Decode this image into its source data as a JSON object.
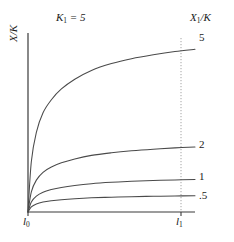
{
  "figure": {
    "title": "K1 = 5",
    "title_parts": {
      "symbol": "K",
      "subscript": "1",
      "equals": " = ",
      "value": "5"
    },
    "background_color": "#ffffff",
    "line_color": "#4a4a4a",
    "axis_color": "#3a3a3a",
    "guide_color": "#9a9a9a"
  },
  "axes": {
    "y_label": "X/K",
    "y_label_parts": {
      "numerator": "X",
      "denominator": "K"
    },
    "right_label": "X1/K",
    "right_label_parts": {
      "symbol": "X",
      "subscript": "1",
      "denominator": "K"
    },
    "x_ticks": [
      {
        "label": "l0",
        "symbol": "l",
        "subscript": "0"
      },
      {
        "label": "l1",
        "symbol": "l",
        "subscript": "1"
      }
    ]
  },
  "chart_data": {
    "type": "line",
    "title": "K1 = 5",
    "xlabel": "",
    "ylabel": "X/K",
    "grid": false,
    "legend_position": "right-endpoint-labels",
    "xlim": [
      0,
      1
    ],
    "ylim": [
      0,
      5.5
    ],
    "x_tick_labels": [
      "l0",
      "l1"
    ],
    "x_tick_values": [
      0,
      0.915
    ],
    "annotations": [
      {
        "text": "K1 = 5",
        "position": "top-center"
      },
      {
        "text": "X1/K",
        "position": "top-right"
      }
    ],
    "guides": [
      {
        "type": "vline",
        "x": 0.915,
        "style": "dotted",
        "label": "l1"
      }
    ],
    "series": [
      {
        "name": "5",
        "endpoint_label": "5",
        "asymptote": 5,
        "x": [
          0,
          0.02,
          0.05,
          0.09,
          0.14,
          0.2,
          0.28,
          0.38,
          0.5,
          0.62,
          0.75,
          0.88,
          1.0
        ],
        "values": [
          0,
          1.55,
          2.45,
          3.05,
          3.45,
          3.78,
          4.08,
          4.35,
          4.56,
          4.71,
          4.83,
          4.93,
          5.0
        ]
      },
      {
        "name": "2",
        "endpoint_label": "2",
        "asymptote": 2,
        "x": [
          0,
          0.02,
          0.05,
          0.09,
          0.14,
          0.2,
          0.28,
          0.38,
          0.5,
          0.62,
          0.75,
          0.88,
          1.0
        ],
        "values": [
          0,
          0.62,
          0.98,
          1.22,
          1.38,
          1.51,
          1.63,
          1.74,
          1.82,
          1.88,
          1.93,
          1.97,
          2.0
        ]
      },
      {
        "name": "1",
        "endpoint_label": "1",
        "asymptote": 1,
        "x": [
          0,
          0.02,
          0.05,
          0.09,
          0.14,
          0.2,
          0.28,
          0.38,
          0.5,
          0.62,
          0.75,
          0.88,
          1.0
        ],
        "values": [
          0,
          0.31,
          0.49,
          0.61,
          0.69,
          0.756,
          0.816,
          0.87,
          0.912,
          0.942,
          0.966,
          0.986,
          1.0
        ]
      },
      {
        "name": ".5",
        "endpoint_label": ".5",
        "asymptote": 0.5,
        "x": [
          0,
          0.02,
          0.05,
          0.09,
          0.14,
          0.2,
          0.28,
          0.38,
          0.5,
          0.62,
          0.75,
          0.88,
          1.0
        ],
        "values": [
          0,
          0.155,
          0.245,
          0.305,
          0.345,
          0.378,
          0.408,
          0.435,
          0.456,
          0.471,
          0.483,
          0.493,
          0.5
        ]
      }
    ]
  }
}
